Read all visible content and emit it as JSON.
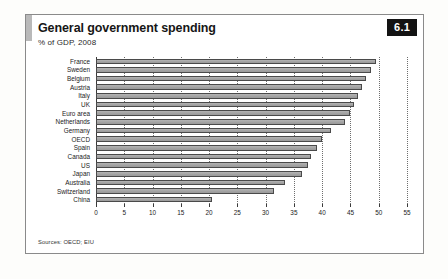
{
  "panel": {
    "title": "General government spending",
    "subtitle": "% of GDP, 2008",
    "badge": "6.1",
    "source": "Sources: OECD; EIU"
  },
  "chart_data": {
    "type": "bar",
    "orientation": "horizontal",
    "title": "General government spending",
    "subtitle": "% of GDP, 2008",
    "xlabel": "",
    "ylabel": "",
    "xlim": [
      0,
      55
    ],
    "xticks": [
      0,
      5,
      10,
      15,
      20,
      25,
      30,
      35,
      40,
      45,
      50,
      55
    ],
    "grid": true,
    "grid_style": "dotted vertical",
    "legend": "none",
    "bar_color": "#a8a8a8",
    "bar_border_color": "#4a4a4a",
    "categories": [
      "France",
      "Sweden",
      "Belgium",
      "Austria",
      "Italy",
      "UK",
      "Euro area",
      "Netherlands",
      "Germany",
      "OECD",
      "Spain",
      "Canada",
      "US",
      "Japan",
      "Australia",
      "Switzerland",
      "China"
    ],
    "values": [
      49.5,
      48.7,
      47.8,
      47.0,
      46.3,
      45.7,
      45.0,
      44.0,
      41.5,
      40.0,
      39.0,
      38.0,
      37.5,
      36.5,
      33.5,
      31.5,
      20.5
    ],
    "source": "Sources: OECD; EIU"
  }
}
